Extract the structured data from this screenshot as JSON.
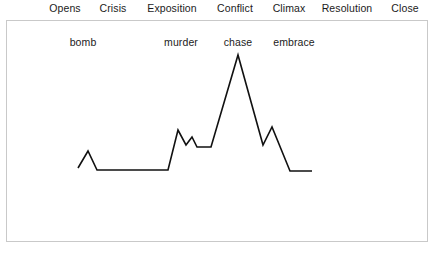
{
  "figure": {
    "background_color": "#ffffff",
    "frame_color": "#c9c9c9",
    "line_color": "#111111",
    "text_color": "#1b1b1b"
  },
  "stage_axis": {
    "labels": [
      {
        "label": "Opens",
        "center_x": 65
      },
      {
        "label": "Crisis",
        "center_x": 113
      },
      {
        "label": "Exposition",
        "center_x": 172
      },
      {
        "label": "Conflict",
        "center_x": 235
      },
      {
        "label": "Climax",
        "center_x": 289
      },
      {
        "label": "Resolution",
        "center_x": 347
      },
      {
        "label": "Close",
        "center_x": 405
      }
    ]
  },
  "events": [
    {
      "label": "bomb",
      "center_x": 83,
      "y": 36
    },
    {
      "label": "murder",
      "center_x": 181,
      "y": 36
    },
    {
      "label": "chase",
      "center_x": 238,
      "y": 36
    },
    {
      "label": "embrace",
      "center_x": 294,
      "y": 36
    }
  ],
  "chart_data": {
    "type": "line",
    "title": "",
    "subtitle": "",
    "xlabel": "",
    "ylabel": "",
    "grid": false,
    "legend_position": "none",
    "axis_visible": false,
    "xlim": [
      78,
      312
    ],
    "ylim": [
      55,
      171
    ],
    "y_direction": "screen-pixels (smaller y = higher tension)",
    "series": [
      {
        "name": "tension",
        "points": [
          {
            "x": 78,
            "y": 168,
            "note": "opens, low baseline"
          },
          {
            "x": 88,
            "y": 151,
            "note": "bomb spike"
          },
          {
            "x": 97,
            "y": 170,
            "note": "back to baseline"
          },
          {
            "x": 168,
            "y": 170,
            "note": "long flat exposition"
          },
          {
            "x": 178,
            "y": 130,
            "note": "murder spike"
          },
          {
            "x": 186,
            "y": 145,
            "note": "dip after murder"
          },
          {
            "x": 192,
            "y": 137,
            "note": "secondary small spike"
          },
          {
            "x": 197,
            "y": 147,
            "note": "dip"
          },
          {
            "x": 211,
            "y": 147,
            "note": "short plateau of rising conflict"
          },
          {
            "x": 238,
            "y": 55,
            "note": "chase - climax apex"
          },
          {
            "x": 263,
            "y": 145,
            "note": "post-climax fall"
          },
          {
            "x": 272,
            "y": 127,
            "note": "embrace spike"
          },
          {
            "x": 290,
            "y": 171,
            "note": "resolution descent"
          },
          {
            "x": 312,
            "y": 171,
            "note": "close, flat low"
          }
        ]
      }
    ]
  }
}
